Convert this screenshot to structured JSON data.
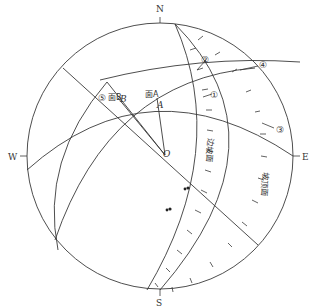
{
  "diagram": {
    "type": "stereographic projection (stereonet)",
    "compass": {
      "north": "N",
      "south": "S",
      "west": "W",
      "east": "E"
    },
    "center_label": "O",
    "planes": {
      "plane_a_label": "面A",
      "plane_a_pole": "A",
      "plane_b_label": "面B",
      "plane_b_pole": "B",
      "slope_face_label": "边坡面",
      "slope_top_label": "坡顶面"
    },
    "intersections": [
      "①",
      "②",
      "③",
      "④",
      "⑤"
    ],
    "colors": {
      "line": "#3a3a3a",
      "background": "#ffffff"
    }
  }
}
